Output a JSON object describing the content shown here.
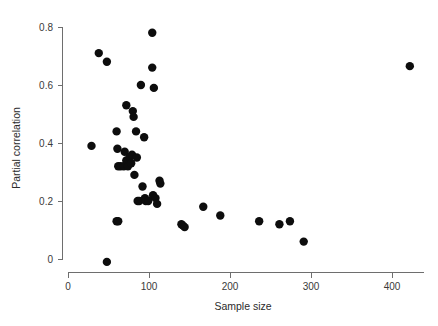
{
  "chart_data": {
    "type": "scatter",
    "title": "",
    "subtitle": "",
    "xlabel": "Sample size",
    "ylabel": "Partial correlation",
    "xlim": [
      0,
      440
    ],
    "ylim": [
      -0.03,
      0.82
    ],
    "xticks": [
      0,
      100,
      200,
      300,
      400
    ],
    "xtick_labels": [
      "0",
      "100",
      "200",
      "300",
      "400"
    ],
    "yticks": [
      0,
      0.2,
      0.4,
      0.6,
      0.8
    ],
    "ytick_labels": [
      "0",
      "0.2",
      "0.4",
      "0.6",
      "0.8"
    ],
    "grid": false,
    "legend": null,
    "legend_position": "none",
    "marker": "filled-circle",
    "marker_color": "#0d0d0d",
    "marker_size": 4.2,
    "series": [
      {
        "name": "studies",
        "points": [
          [
            29,
            0.39
          ],
          [
            38,
            0.71
          ],
          [
            48,
            0.68
          ],
          [
            48,
            -0.01
          ],
          [
            60,
            0.44
          ],
          [
            60,
            0.13
          ],
          [
            62,
            0.13
          ],
          [
            61,
            0.38
          ],
          [
            62,
            0.32
          ],
          [
            65,
            0.32
          ],
          [
            69,
            0.32
          ],
          [
            70,
            0.37
          ],
          [
            72,
            0.53
          ],
          [
            72,
            0.34
          ],
          [
            74,
            0.32
          ],
          [
            76,
            0.35
          ],
          [
            78,
            0.33
          ],
          [
            79,
            0.36
          ],
          [
            80,
            0.51
          ],
          [
            81,
            0.49
          ],
          [
            82,
            0.29
          ],
          [
            84,
            0.44
          ],
          [
            85,
            0.35
          ],
          [
            86,
            0.2
          ],
          [
            88,
            0.2
          ],
          [
            90,
            0.6
          ],
          [
            92,
            0.25
          ],
          [
            94,
            0.42
          ],
          [
            95,
            0.21
          ],
          [
            96,
            0.2
          ],
          [
            99,
            0.2
          ],
          [
            104,
            0.78
          ],
          [
            104,
            0.66
          ],
          [
            105,
            0.22
          ],
          [
            106,
            0.59
          ],
          [
            108,
            0.21
          ],
          [
            110,
            0.19
          ],
          [
            113,
            0.27
          ],
          [
            114,
            0.26
          ],
          [
            140,
            0.12
          ],
          [
            142,
            0.115
          ],
          [
            144,
            0.11
          ],
          [
            167,
            0.18
          ],
          [
            188,
            0.15
          ],
          [
            236,
            0.13
          ],
          [
            261,
            0.12
          ],
          [
            274,
            0.13
          ],
          [
            291,
            0.06
          ],
          [
            422,
            0.665
          ]
        ]
      }
    ]
  },
  "axes": {
    "x_axis_name": "sample-size-axis",
    "y_axis_name": "partial-correlation-axis"
  }
}
